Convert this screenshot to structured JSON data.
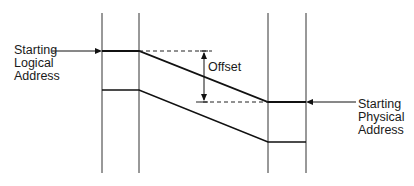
{
  "diagram": {
    "type": "address-translation-offset",
    "labels": {
      "logical": [
        "Starting",
        "Logical",
        "Address"
      ],
      "physical": [
        "Starting",
        "Physical",
        "Address"
      ],
      "offset": "Offset"
    },
    "colors": {
      "line": "#1a1a1a",
      "background": "#ffffff"
    }
  }
}
